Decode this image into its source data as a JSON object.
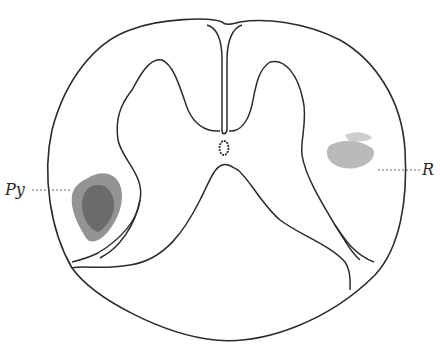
{
  "figure": {
    "labels": {
      "left": "Py",
      "right": "R"
    },
    "colors": {
      "outline": "#2b2b2b",
      "stipple": "#3a3a3a",
      "background": "#ffffff"
    }
  }
}
